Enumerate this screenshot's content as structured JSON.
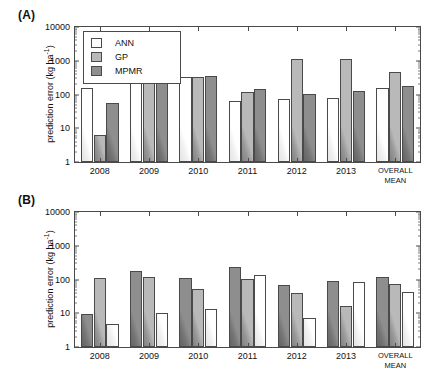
{
  "figure": {
    "panels": [
      {
        "id": "A",
        "label": "(A)"
      },
      {
        "id": "B",
        "label": "(B)"
      }
    ]
  },
  "axis": {
    "ylabel_text": "prediction error (kg ha",
    "ylabel_sup": "-1",
    "ylabel_tail": ")",
    "yticks": [
      "1",
      "10",
      "100",
      "1000",
      "10000"
    ]
  },
  "legend": {
    "items": [
      {
        "key": "ann",
        "label": "ANN"
      },
      {
        "key": "gp",
        "label": "GP"
      },
      {
        "key": "mpmr",
        "label": "MPMR"
      }
    ]
  },
  "colors": {
    "ann": "#ffffff",
    "gp": "#b9b9b9",
    "mpmr": "#8e8e8e",
    "axis": "#4a4a4a",
    "text": "#111111"
  },
  "chart_data": [
    {
      "type": "bar",
      "panel": "A",
      "title": "(A)",
      "xlabel": "",
      "ylabel": "prediction error (kg ha-1)",
      "yscale": "log",
      "ylim": [
        1,
        10000
      ],
      "grid": false,
      "legend_position": "top-left inside",
      "categories": [
        "2008",
        "2009",
        "2010",
        "2011",
        "2012",
        "2013",
        "OVERALL\nMEAN"
      ],
      "bar_order": [
        "ANN",
        "GP",
        "MPMR"
      ],
      "series": [
        {
          "name": "ANN",
          "values": [
            155,
            250,
            330,
            63,
            75,
            78,
            155
          ]
        },
        {
          "name": "GP",
          "values": [
            6.5,
            240,
            330,
            115,
            1100,
            1100,
            480
          ]
        },
        {
          "name": "MPMR",
          "values": [
            57,
            270,
            350,
            150,
            105,
            130,
            180
          ]
        }
      ]
    },
    {
      "type": "bar",
      "panel": "B",
      "title": "(B)",
      "xlabel": "",
      "ylabel": "prediction error (kg ha-1)",
      "yscale": "log",
      "ylim": [
        1,
        10000
      ],
      "grid": false,
      "legend_position": "none",
      "categories": [
        "2008",
        "2009",
        "2010",
        "2011",
        "2012",
        "2013",
        "OVERALL\nMEAN"
      ],
      "bar_order": [
        "MPMR",
        "GP",
        "ANN"
      ],
      "series": [
        {
          "name": "MPMR",
          "values": [
            9.5,
            175,
            110,
            230,
            68,
            90,
            115
          ]
        },
        {
          "name": "GP",
          "values": [
            110,
            115,
            54,
            105,
            39,
            16,
            72
          ]
        },
        {
          "name": "ANN",
          "values": [
            4.7,
            10.5,
            13,
            140,
            7.2,
            87,
            43
          ]
        }
      ]
    }
  ]
}
